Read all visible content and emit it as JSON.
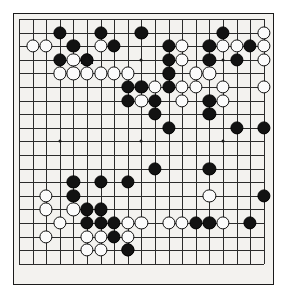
{
  "diagram": {
    "kind": "go-board",
    "board_size": 19,
    "background_color": "#f3f2ef",
    "line_color": "#2b2b2b",
    "border_color": "#1b1b1b",
    "black_color": "#121212",
    "white_color": "#fbfbfb",
    "geometry": {
      "origin_x": 19.0,
      "origin_y": 19.0,
      "spacing": 13.6,
      "stone_radius": 6.6,
      "panel_left": 13,
      "panel_top": 13,
      "panel_width": 261,
      "panel_height": 272
    },
    "hoshi_points": [
      [
        4,
        4
      ],
      [
        10,
        4
      ],
      [
        16,
        4
      ],
      [
        4,
        10
      ],
      [
        10,
        10
      ],
      [
        16,
        10
      ],
      [
        4,
        16
      ],
      [
        10,
        16
      ],
      [
        16,
        16
      ]
    ],
    "black_stones": [
      [
        4,
        2
      ],
      [
        7,
        2
      ],
      [
        10,
        2
      ],
      [
        16,
        2
      ],
      [
        5,
        3
      ],
      [
        8,
        3
      ],
      [
        12,
        3
      ],
      [
        15,
        3
      ],
      [
        18,
        3
      ],
      [
        4,
        4
      ],
      [
        6,
        4
      ],
      [
        12,
        4
      ],
      [
        15,
        4
      ],
      [
        17,
        4
      ],
      [
        12,
        5
      ],
      [
        9,
        6
      ],
      [
        10,
        6
      ],
      [
        12,
        6
      ],
      [
        9,
        7
      ],
      [
        11,
        7
      ],
      [
        15,
        7
      ],
      [
        11,
        8
      ],
      [
        15,
        8
      ],
      [
        12,
        9
      ],
      [
        17,
        9
      ],
      [
        19,
        9
      ],
      [
        11,
        12
      ],
      [
        15,
        12
      ],
      [
        5,
        13
      ],
      [
        7,
        13
      ],
      [
        9,
        13
      ],
      [
        5,
        14
      ],
      [
        19,
        14
      ],
      [
        6,
        15
      ],
      [
        7,
        15
      ],
      [
        6,
        16
      ],
      [
        7,
        16
      ],
      [
        8,
        16
      ],
      [
        14,
        16
      ],
      [
        15,
        16
      ],
      [
        18,
        16
      ],
      [
        8,
        17
      ],
      [
        9,
        18
      ]
    ],
    "white_stones": [
      [
        19,
        2
      ],
      [
        2,
        3
      ],
      [
        3,
        3
      ],
      [
        7,
        3
      ],
      [
        13,
        3
      ],
      [
        16,
        3
      ],
      [
        17,
        3
      ],
      [
        19,
        3
      ],
      [
        5,
        4
      ],
      [
        6,
        4
      ],
      [
        13,
        4
      ],
      [
        19,
        4
      ],
      [
        4,
        5
      ],
      [
        5,
        5
      ],
      [
        6,
        5
      ],
      [
        7,
        5
      ],
      [
        8,
        5
      ],
      [
        9,
        5
      ],
      [
        14,
        5
      ],
      [
        15,
        5
      ],
      [
        11,
        6
      ],
      [
        13,
        6
      ],
      [
        14,
        6
      ],
      [
        16,
        6
      ],
      [
        19,
        6
      ],
      [
        10,
        7
      ],
      [
        13,
        7
      ],
      [
        16,
        7
      ],
      [
        3,
        14
      ],
      [
        15,
        14
      ],
      [
        3,
        15
      ],
      [
        5,
        15
      ],
      [
        4,
        16
      ],
      [
        10,
        16
      ],
      [
        12,
        16
      ],
      [
        13,
        16
      ],
      [
        9,
        16
      ],
      [
        16,
        16
      ],
      [
        3,
        17
      ],
      [
        6,
        17
      ],
      [
        7,
        17
      ],
      [
        9,
        17
      ],
      [
        6,
        18
      ],
      [
        7,
        18
      ],
      [
        9,
        18
      ]
    ],
    "marked_stones": [
      {
        "col": 6,
        "row": 4,
        "color": "white",
        "mark": "triangle"
      }
    ],
    "marked_stone_note": "triangle-marked white stone"
  }
}
